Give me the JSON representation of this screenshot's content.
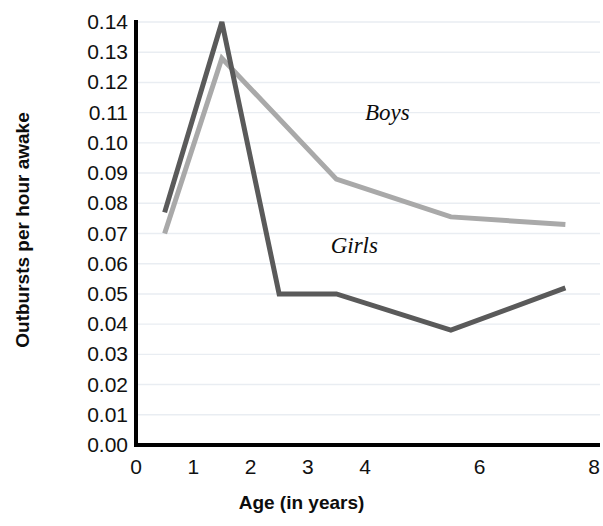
{
  "chart_data": {
    "type": "line",
    "title": "",
    "xlabel": "Age (in years)",
    "ylabel": "Outbursts per hour awake",
    "xlim": [
      0,
      8
    ],
    "ylim": [
      0.0,
      0.14
    ],
    "grid": true,
    "grid_axis": "y",
    "legend": "inline-annotations",
    "x_ticks": [
      0,
      1,
      2,
      3,
      4,
      6,
      8
    ],
    "x_tick_labels": [
      "0",
      "1",
      "2",
      "3",
      "4",
      "6",
      "8"
    ],
    "y_ticks": [
      0.0,
      0.01,
      0.02,
      0.03,
      0.04,
      0.05,
      0.06,
      0.07,
      0.08,
      0.09,
      0.1,
      0.11,
      0.12,
      0.13,
      0.14
    ],
    "y_tick_labels": [
      "0.00",
      "0.01",
      "0.02",
      "0.03",
      "0.04",
      "0.05",
      "0.06",
      "0.07",
      "0.08",
      "0.09",
      "0.10",
      "0.11",
      "0.12",
      "0.13",
      "0.14"
    ],
    "series": [
      {
        "name": "Boys",
        "color": "#a9a9a9",
        "x": [
          0.5,
          1.5,
          3.5,
          5.5,
          7.5
        ],
        "values": [
          0.07,
          0.128,
          0.088,
          0.0755,
          0.073
        ],
        "label_x": 4.0,
        "label_y": 0.1095
      },
      {
        "name": "Girls",
        "color": "#5a5a5a",
        "x": [
          0.5,
          1.5,
          2.5,
          3.5,
          5.5,
          7.5
        ],
        "values": [
          0.077,
          0.14,
          0.05,
          0.05,
          0.038,
          0.052
        ],
        "label_x": 3.4,
        "label_y": 0.0655
      }
    ]
  },
  "annotations": {
    "boys_label": "Boys",
    "girls_label": "Girls"
  },
  "axes": {
    "x_title": "Age (in years)",
    "y_title": "Outbursts per hour awake"
  },
  "colors": {
    "boys_line": "#a9a9a9",
    "girls_line": "#5a5a5a",
    "axis": "#000000",
    "gridline": "#e9edf2",
    "text": "#111111"
  }
}
